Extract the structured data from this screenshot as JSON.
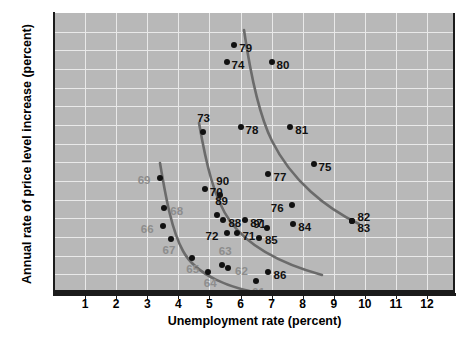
{
  "chart_data": {
    "type": "scatter",
    "title": "",
    "xlabel": "Unemployment rate (percent)",
    "ylabel": "Annual rate of price level increase (percent)",
    "xlim": [
      0,
      12.9
    ],
    "ylim": [
      0,
      15
    ],
    "xticks": [
      1,
      2,
      3,
      4,
      5,
      6,
      7,
      8,
      9,
      10,
      11,
      12
    ],
    "yticks": [
      0,
      1,
      2,
      3,
      4,
      5,
      6,
      7,
      8,
      9,
      10,
      11,
      12,
      13,
      14
    ],
    "grid": true,
    "legend": "none",
    "plot_background": "#b8b8b8",
    "gridline_color": "#e9e9e9",
    "point_color": "#111111",
    "curve_color": "#6b6b6b",
    "points": [
      {
        "label": "61",
        "x": 6.5,
        "y": 0.65,
        "label_dx": -4,
        "label_dy": 12,
        "color": "gray"
      },
      {
        "label": "62",
        "x": 5.6,
        "y": 1.35,
        "label_dx": 7,
        "label_dy": 4,
        "color": "gray"
      },
      {
        "label": "63",
        "x": 5.4,
        "y": 1.5,
        "label_dx": -3,
        "label_dy": -13,
        "color": "gray"
      },
      {
        "label": "64",
        "x": 4.95,
        "y": 1.15,
        "label_dx": -4,
        "label_dy": 12,
        "color": "gray"
      },
      {
        "label": "65",
        "x": 4.45,
        "y": 1.85,
        "label_dx": -6,
        "label_dy": 12,
        "color": "gray"
      },
      {
        "label": "66",
        "x": 3.5,
        "y": 3.6,
        "label_dx": -22,
        "label_dy": 4,
        "color": "gray"
      },
      {
        "label": "67",
        "x": 3.75,
        "y": 2.9,
        "label_dx": -8,
        "label_dy": 12,
        "color": "gray"
      },
      {
        "label": "68",
        "x": 3.55,
        "y": 4.55,
        "label_dx": 6,
        "label_dy": 4,
        "color": "gray"
      },
      {
        "label": "69",
        "x": 3.4,
        "y": 6.15,
        "label_dx": -22,
        "label_dy": 3,
        "color": "gray"
      },
      {
        "label": "70",
        "x": 4.85,
        "y": 5.55,
        "label_dx": 5,
        "label_dy": 4,
        "color": "black"
      },
      {
        "label": "71",
        "x": 5.9,
        "y": 3.2,
        "label_dx": 5,
        "label_dy": 4,
        "color": "black"
      },
      {
        "label": "72",
        "x": 5.55,
        "y": 3.2,
        "label_dx": -21,
        "label_dy": 4,
        "color": "black"
      },
      {
        "label": "73",
        "x": 4.8,
        "y": 8.65,
        "label_dx": -6,
        "label_dy": -13,
        "color": "black"
      },
      {
        "label": "74",
        "x": 5.55,
        "y": 12.35,
        "label_dx": 5,
        "label_dy": 4,
        "color": "black"
      },
      {
        "label": "75",
        "x": 8.35,
        "y": 6.9,
        "label_dx": 5,
        "label_dy": 4,
        "color": "black"
      },
      {
        "label": "76",
        "x": 7.65,
        "y": 4.7,
        "label_dx": -21,
        "label_dy": 4,
        "color": "black"
      },
      {
        "label": "77",
        "x": 6.9,
        "y": 6.35,
        "label_dx": 5,
        "label_dy": 4,
        "color": "black"
      },
      {
        "label": "78",
        "x": 6.0,
        "y": 8.9,
        "label_dx": 5,
        "label_dy": 4,
        "color": "black"
      },
      {
        "label": "79",
        "x": 5.8,
        "y": 13.3,
        "label_dx": 5,
        "label_dy": 4,
        "color": "black"
      },
      {
        "label": "80",
        "x": 7.0,
        "y": 12.4,
        "label_dx": 5,
        "label_dy": 4,
        "color": "black"
      },
      {
        "label": "81",
        "x": 7.6,
        "y": 8.9,
        "label_dx": 5,
        "label_dy": 4,
        "color": "black"
      },
      {
        "label": "82",
        "x": 9.6,
        "y": 3.85,
        "label_dx": 5,
        "label_dy": -3,
        "color": "black"
      },
      {
        "label": "83",
        "x": 9.6,
        "y": 3.85,
        "label_dx": 5,
        "label_dy": 8,
        "color": "black"
      },
      {
        "label": "84",
        "x": 7.7,
        "y": 3.7,
        "label_dx": 5,
        "label_dy": 4,
        "color": "black"
      },
      {
        "label": "85",
        "x": 6.85,
        "y": 3.5,
        "label_dx": -2,
        "label_dy": 13,
        "color": "black"
      },
      {
        "label": "86",
        "x": 6.9,
        "y": 1.15,
        "label_dx": 5,
        "label_dy": 4,
        "color": "black"
      },
      {
        "label": "87",
        "x": 6.15,
        "y": 3.9,
        "label_dx": 5,
        "label_dy": 4,
        "color": "black"
      },
      {
        "label": "88",
        "x": 5.45,
        "y": 3.9,
        "label_dx": 5,
        "label_dy": 4,
        "color": "black"
      },
      {
        "label": "89",
        "x": 5.25,
        "y": 4.2,
        "label_dx": -2,
        "label_dy": -13,
        "color": "black"
      },
      {
        "label": "90",
        "x": 5.35,
        "y": 5.25,
        "label_dx": -4,
        "label_dy": -13,
        "color": "black"
      },
      {
        "label": "91",
        "x": 6.6,
        "y": 2.95,
        "label_dx": -6,
        "label_dy": -13,
        "color": "black"
      }
    ],
    "curves": [
      {
        "name": "phillips-curve-1960s",
        "path": "M 106,150 C 112,186 118,218 129,238 C 142,262 176,276 212,281"
      },
      {
        "name": "phillips-curve-1970s",
        "path": "M 145,110 C 152,150 160,186 176,208 C 196,236 232,252 268,262"
      },
      {
        "name": "phillips-curve-1980s",
        "path": "M 190,17 C 196,58 204,100 218,128 C 238,168 272,195 305,211"
      }
    ]
  }
}
